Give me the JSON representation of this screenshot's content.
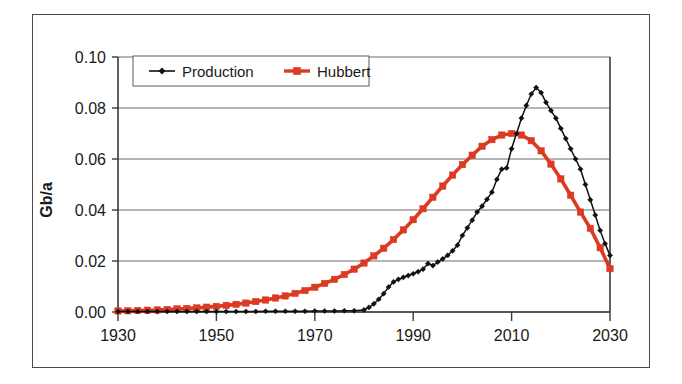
{
  "chart_data": {
    "type": "line",
    "title": "",
    "xlabel": "",
    "ylabel": "Gb/a",
    "xlim": [
      1930,
      2030
    ],
    "ylim": [
      0.0,
      0.1
    ],
    "xticks": [
      "1930",
      "1950",
      "1970",
      "1990",
      "2010",
      "2030"
    ],
    "xtick_values": [
      1930,
      1950,
      1970,
      1990,
      2010,
      2030
    ],
    "yticks": [
      "0.00",
      "0.02",
      "0.04",
      "0.06",
      "0.08",
      "0.10"
    ],
    "ytick_values": [
      0.0,
      0.02,
      0.04,
      0.06,
      0.08,
      0.1
    ],
    "grid": "horizontal",
    "legend_position": "top-left-inside",
    "series": [
      {
        "name": "Production",
        "color": "#111111",
        "marker": "diamond",
        "x": [
          1930,
          1932,
          1934,
          1936,
          1938,
          1940,
          1942,
          1944,
          1946,
          1948,
          1950,
          1952,
          1954,
          1956,
          1958,
          1960,
          1962,
          1964,
          1966,
          1968,
          1970,
          1972,
          1974,
          1976,
          1978,
          1980,
          1981,
          1982,
          1983,
          1984,
          1985,
          1986,
          1987,
          1988,
          1989,
          1990,
          1991,
          1992,
          1993,
          1994,
          1995,
          1996,
          1997,
          1998,
          1999,
          2000,
          2001,
          2002,
          2003,
          2004,
          2005,
          2006,
          2007,
          2008,
          2009,
          2010,
          2011,
          2012,
          2013,
          2014,
          2015,
          2016,
          2017,
          2018,
          2019,
          2020,
          2021,
          2022,
          2023,
          2024,
          2025,
          2026,
          2027,
          2028,
          2029,
          2030
        ],
        "y": [
          0.0002,
          0.0002,
          0.0002,
          0.0002,
          0.0002,
          0.0002,
          0.0002,
          0.0002,
          0.0002,
          0.0002,
          0.0002,
          0.0002,
          0.0002,
          0.0002,
          0.0002,
          0.0003,
          0.0003,
          0.0003,
          0.0003,
          0.0003,
          0.0004,
          0.0004,
          0.0004,
          0.0005,
          0.0005,
          0.0008,
          0.0018,
          0.0032,
          0.005,
          0.0072,
          0.0098,
          0.0118,
          0.0128,
          0.0136,
          0.0143,
          0.015,
          0.0158,
          0.0168,
          0.019,
          0.0182,
          0.0196,
          0.0208,
          0.0222,
          0.024,
          0.0262,
          0.03,
          0.033,
          0.036,
          0.0392,
          0.0415,
          0.0442,
          0.047,
          0.052,
          0.056,
          0.0565,
          0.064,
          0.07,
          0.076,
          0.081,
          0.0855,
          0.088,
          0.086,
          0.0822,
          0.079,
          0.076,
          0.072,
          0.068,
          0.064,
          0.06,
          0.056,
          0.05,
          0.044,
          0.038,
          0.032,
          0.0268,
          0.0222
        ]
      },
      {
        "name": "Hubbert",
        "color": "#dc3a22",
        "marker": "square",
        "x": [
          1930,
          1932,
          1934,
          1936,
          1938,
          1940,
          1942,
          1944,
          1946,
          1948,
          1950,
          1952,
          1954,
          1956,
          1958,
          1960,
          1962,
          1964,
          1966,
          1968,
          1970,
          1972,
          1974,
          1976,
          1978,
          1980,
          1982,
          1984,
          1986,
          1988,
          1990,
          1992,
          1994,
          1996,
          1998,
          2000,
          2002,
          2004,
          2006,
          2008,
          2010,
          2012,
          2014,
          2016,
          2018,
          2020,
          2022,
          2024,
          2026,
          2028,
          2030
        ],
        "y": [
          0.0004,
          0.0005,
          0.0006,
          0.0007,
          0.0008,
          0.001,
          0.0012,
          0.0014,
          0.0016,
          0.0019,
          0.0022,
          0.0026,
          0.003,
          0.0035,
          0.0041,
          0.0047,
          0.0055,
          0.0063,
          0.0073,
          0.0084,
          0.0097,
          0.0112,
          0.0128,
          0.0147,
          0.0168,
          0.0192,
          0.022,
          0.025,
          0.0284,
          0.0322,
          0.0362,
          0.0405,
          0.045,
          0.0494,
          0.0537,
          0.0578,
          0.0615,
          0.065,
          0.0676,
          0.0694,
          0.07,
          0.0694,
          0.0672,
          0.0632,
          0.058,
          0.0522,
          0.0458,
          0.0392,
          0.0328,
          0.0252,
          0.017
        ]
      }
    ]
  },
  "legend": {
    "items": [
      {
        "label": "Production",
        "color": "#111111",
        "marker": "diamond"
      },
      {
        "label": "Hubbert",
        "color": "#dc3a22",
        "marker": "square"
      }
    ]
  },
  "axis": {
    "y_title": "Gb/a"
  },
  "colors": {
    "production": "#111111",
    "hubbert": "#dc3a22",
    "axis": "#3a3a3a",
    "grid": "#6b6b6b",
    "frame": "#4a4a4a",
    "background": "#ffffff"
  }
}
